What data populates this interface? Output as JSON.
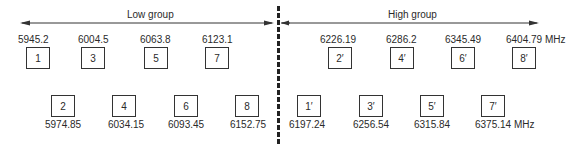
{
  "groups": {
    "low": {
      "label": "Low group"
    },
    "high": {
      "label": "High group"
    }
  },
  "unit": "MHz",
  "channels": {
    "low_top": [
      {
        "id": "1",
        "freq": "5945.2"
      },
      {
        "id": "3",
        "freq": "6004.5"
      },
      {
        "id": "5",
        "freq": "6063.8"
      },
      {
        "id": "7",
        "freq": "6123.1"
      }
    ],
    "low_bottom": [
      {
        "id": "2",
        "freq": "5974.85"
      },
      {
        "id": "4",
        "freq": "6034.15"
      },
      {
        "id": "6",
        "freq": "6093.45"
      },
      {
        "id": "8",
        "freq": "6152.75"
      }
    ],
    "high_top": [
      {
        "id": "2′",
        "freq": "6226.19"
      },
      {
        "id": "4′",
        "freq": "6286.2"
      },
      {
        "id": "6′",
        "freq": "6345.49"
      },
      {
        "id": "8′",
        "freq": "6404.79 MHz"
      }
    ],
    "high_bottom": [
      {
        "id": "1′",
        "freq": "6197.24"
      },
      {
        "id": "3′",
        "freq": "6256.54"
      },
      {
        "id": "5′",
        "freq": "6315.84"
      },
      {
        "id": "7′",
        "freq": "6375.14 MHz"
      }
    ]
  }
}
